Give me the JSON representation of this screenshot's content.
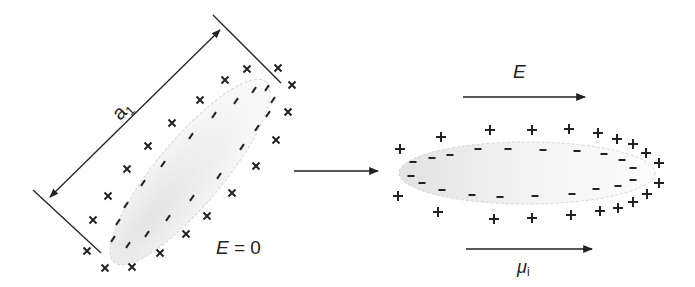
{
  "diagram": {
    "left_panel": {
      "dimension_label": "a",
      "dimension_subscript": "1",
      "field_label": "E = 0",
      "outer_charge_symbol": "×",
      "inner_charge_symbol": "–",
      "outer_charges": [
        [
          278,
          68
        ],
        [
          247,
          69
        ],
        [
          225,
          80
        ],
        [
          200,
          100
        ],
        [
          172,
          123
        ],
        [
          148,
          146
        ],
        [
          127,
          169
        ],
        [
          108,
          196
        ],
        [
          93,
          220
        ],
        [
          87,
          251
        ],
        [
          105,
          268
        ],
        [
          132,
          267
        ],
        [
          292,
          85
        ],
        [
          288,
          112
        ],
        [
          276,
          140
        ],
        [
          256,
          166
        ],
        [
          232,
          193
        ],
        [
          207,
          216
        ],
        [
          186,
          234
        ],
        [
          160,
          253
        ]
      ],
      "inner_charges": [
        [
          254,
          90
        ],
        [
          267,
          88
        ],
        [
          236,
          101
        ],
        [
          273,
          100
        ],
        [
          214,
          115
        ],
        [
          268,
          114
        ],
        [
          191,
          136
        ],
        [
          257,
          128
        ],
        [
          163,
          164
        ],
        [
          242,
          147
        ],
        [
          143,
          183
        ],
        [
          219,
          176
        ],
        [
          126,
          205
        ],
        [
          192,
          198
        ],
        [
          118,
          222
        ],
        [
          168,
          218
        ],
        [
          113,
          239
        ],
        [
          147,
          234
        ],
        [
          128,
          245
        ]
      ]
    },
    "transition_arrow": {
      "from": [
        294,
        171
      ],
      "to": [
        378,
        171
      ]
    },
    "right_panel": {
      "field_label": "E",
      "moment_label": "μ",
      "moment_subscript": "i",
      "outer_charge_symbol": "+",
      "inner_charge_symbol": "–",
      "outer_charges": [
        [
          400,
          149
        ],
        [
          441,
          137
        ],
        [
          490,
          130
        ],
        [
          532,
          130
        ],
        [
          569,
          129
        ],
        [
          598,
          133
        ],
        [
          617,
          139
        ],
        [
          633,
          144
        ],
        [
          646,
          153
        ],
        [
          659,
          163
        ],
        [
          659,
          183
        ],
        [
          647,
          194
        ],
        [
          633,
          202
        ],
        [
          618,
          208
        ],
        [
          600,
          211
        ],
        [
          571,
          215
        ],
        [
          532,
          218
        ],
        [
          494,
          219
        ],
        [
          438,
          212
        ],
        [
          398,
          196
        ]
      ],
      "inner_charges": [
        [
          413,
          162
        ],
        [
          411,
          176
        ],
        [
          432,
          158
        ],
        [
          450,
          155
        ],
        [
          478,
          149
        ],
        [
          508,
          149
        ],
        [
          543,
          150
        ],
        [
          577,
          151
        ],
        [
          604,
          154
        ],
        [
          622,
          160
        ],
        [
          633,
          168
        ],
        [
          633,
          180
        ],
        [
          618,
          186
        ],
        [
          596,
          189
        ],
        [
          572,
          194
        ],
        [
          535,
          196
        ],
        [
          500,
          197
        ],
        [
          472,
          195
        ],
        [
          442,
          190
        ],
        [
          422,
          183
        ]
      ]
    }
  }
}
